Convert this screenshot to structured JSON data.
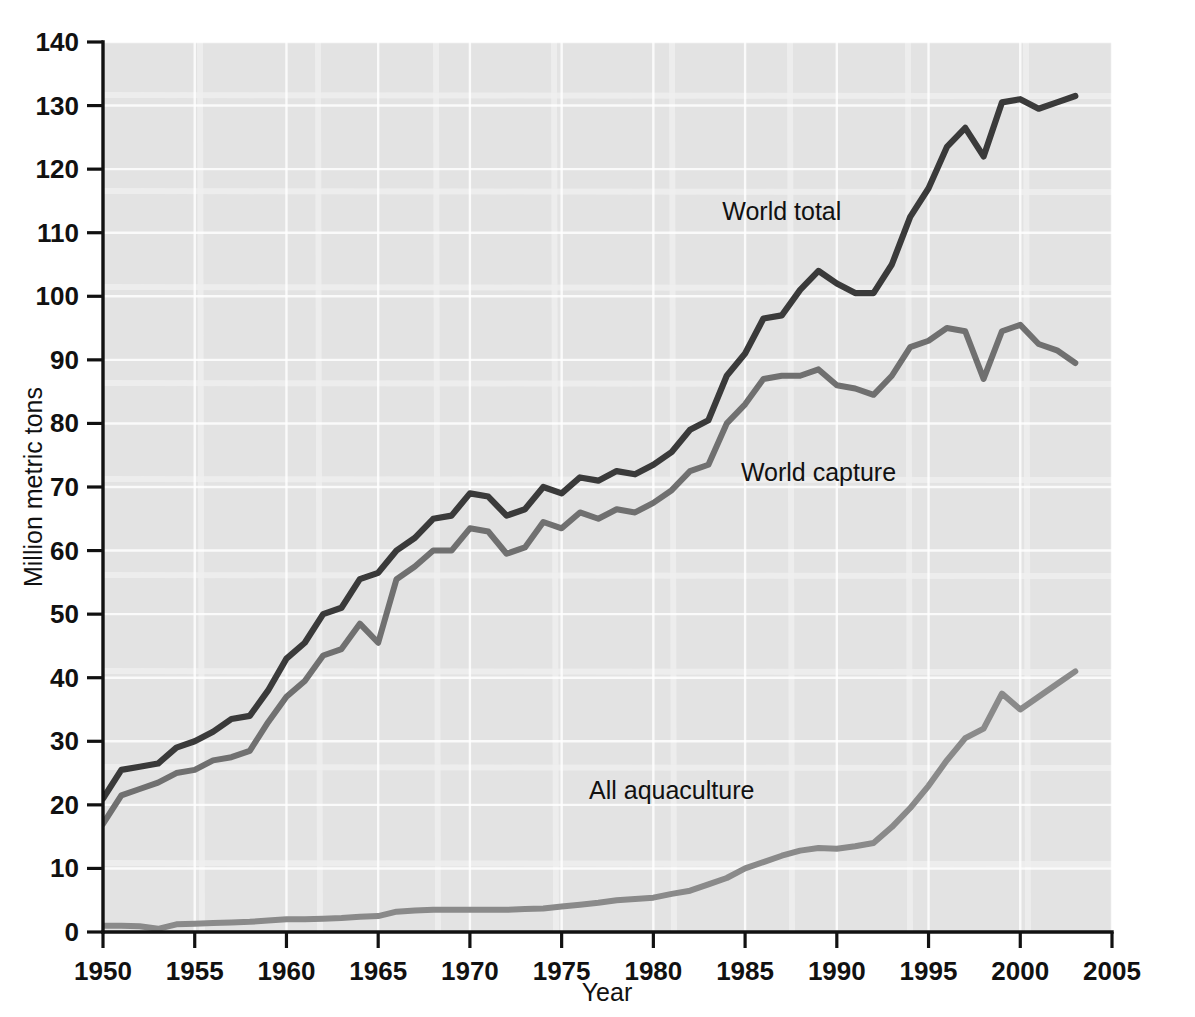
{
  "chart_data": {
    "type": "line",
    "title": "",
    "xlabel": "Year",
    "ylabel": "Million metric tons",
    "xlim": [
      1950,
      2005
    ],
    "ylim": [
      0,
      140
    ],
    "xticks": [
      1950,
      1955,
      1960,
      1965,
      1970,
      1975,
      1980,
      1985,
      1990,
      1995,
      2000,
      2005
    ],
    "yticks": [
      0,
      10,
      20,
      30,
      40,
      50,
      60,
      70,
      80,
      90,
      100,
      110,
      120,
      130,
      140
    ],
    "grid": true,
    "legend_position": "inline-annotations",
    "background_color": "#e3e3e3",
    "x": [
      1950,
      1951,
      1952,
      1953,
      1954,
      1955,
      1956,
      1957,
      1958,
      1959,
      1960,
      1961,
      1962,
      1963,
      1964,
      1965,
      1966,
      1967,
      1968,
      1969,
      1970,
      1971,
      1972,
      1973,
      1974,
      1975,
      1976,
      1977,
      1978,
      1979,
      1980,
      1981,
      1982,
      1983,
      1984,
      1985,
      1986,
      1987,
      1988,
      1989,
      1990,
      1991,
      1992,
      1993,
      1994,
      1995,
      1996,
      1997,
      1998,
      1999,
      2000,
      2001,
      2002,
      2003
    ],
    "series": [
      {
        "name": "World total",
        "color": "#3a3a3a",
        "label_x": 1987,
        "label_y": 112,
        "values": [
          21,
          25.5,
          26,
          26.5,
          29,
          30,
          31.5,
          33.5,
          34,
          38,
          43,
          45.5,
          50,
          51,
          55.5,
          56.5,
          60,
          62,
          65,
          65.5,
          69,
          68.5,
          65.5,
          66.5,
          70,
          69,
          71.5,
          71,
          72.5,
          72,
          73.5,
          75.5,
          79,
          80.5,
          87.5,
          91,
          96.5,
          97,
          101,
          104,
          102,
          100.5,
          100.5,
          105,
          112.5,
          117,
          123.5,
          126.5,
          122,
          130.5,
          131,
          129.5,
          130.5,
          131.5
        ]
      },
      {
        "name": "World capture",
        "color": "#707070",
        "label_x": 1989,
        "label_y": 71,
        "values": [
          17,
          21.5,
          22.5,
          23.5,
          25,
          25.5,
          27,
          27.5,
          28.5,
          33,
          37,
          39.5,
          43.5,
          44.5,
          48.5,
          45.5,
          55.5,
          57.5,
          60,
          60,
          63.5,
          63,
          59.5,
          60.5,
          64.5,
          63.5,
          66,
          65,
          66.5,
          66,
          67.5,
          69.5,
          72.5,
          73.5,
          80,
          83,
          87,
          87.5,
          87.5,
          88.5,
          86,
          85.5,
          84.5,
          87.5,
          92,
          93,
          95,
          94.5,
          87,
          94.5,
          95.5,
          92.5,
          91.5,
          89.5
        ]
      },
      {
        "name": "All aquaculture",
        "color": "#8a8a8a",
        "label_x": 1981,
        "label_y": 21,
        "values": [
          1,
          1,
          0.9,
          0.5,
          1.2,
          1.3,
          1.4,
          1.5,
          1.6,
          1.8,
          2,
          2,
          2.1,
          2.2,
          2.4,
          2.5,
          3.2,
          3.4,
          3.5,
          3.5,
          3.5,
          3.5,
          3.5,
          3.6,
          3.7,
          4,
          4.3,
          4.6,
          5,
          5.2,
          5.4,
          6,
          6.5,
          7.5,
          8.5,
          10,
          11,
          12,
          12.8,
          13.2,
          13.1,
          13.5,
          14,
          16.5,
          19.5,
          23,
          27,
          30.5,
          32,
          37.5,
          35,
          37,
          39,
          41
        ]
      }
    ]
  },
  "axes": {
    "y_axis_label": "Million metric tons",
    "x_axis_label": "Year",
    "x_tick_labels": [
      "1950",
      "1955",
      "1960",
      "1965",
      "1970",
      "1975",
      "1980",
      "1985",
      "1990",
      "1995",
      "2000",
      "2005"
    ],
    "y_tick_labels": [
      "140",
      "130",
      "120",
      "110",
      "100",
      "90",
      "80",
      "70",
      "60",
      "50",
      "40",
      "30",
      "20",
      "10",
      "0"
    ]
  },
  "annotations": [
    {
      "text": "World total"
    },
    {
      "text": "World capture"
    },
    {
      "text": "All aquaculture"
    }
  ]
}
